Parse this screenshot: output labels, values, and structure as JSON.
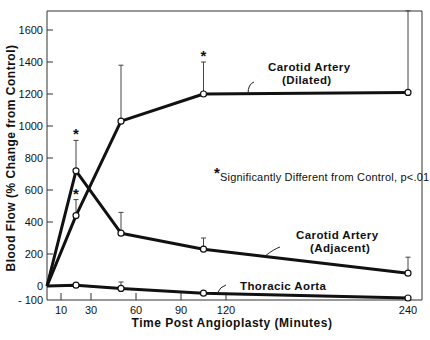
{
  "chart_data": {
    "type": "line",
    "title": "",
    "xlabel": "Time Post Angioplasty (Minutes)",
    "ylabel": "Blood Flow (% Change from Control)",
    "xlim": [
      0,
      240
    ],
    "ylim": [
      -100,
      1760
    ],
    "x_ticks": [
      10,
      30,
      60,
      90,
      120,
      240
    ],
    "y_ticks": [
      -100,
      0,
      200,
      400,
      600,
      800,
      1000,
      1200,
      1400,
      1600
    ],
    "grid": false,
    "legend": "inline labels",
    "annotation": "Significantly Different from Control, p<.01",
    "annotation_marker": "*",
    "x": [
      0,
      20,
      50,
      105,
      240
    ],
    "series": [
      {
        "name": "Carotid Artery (Dilated)",
        "label_lines": [
          "Carotid Artery",
          "(Dilated)"
        ],
        "values": [
          0,
          440,
          1030,
          1200,
          1210
        ],
        "error_upper": [
          null,
          540,
          1380,
          1400,
          1720
        ],
        "significant": [
          false,
          true,
          false,
          true,
          false
        ]
      },
      {
        "name": "Carotid Artery (Adjacent)",
        "label_lines": [
          "Carotid Artery",
          "(Adjacent)"
        ],
        "values": [
          0,
          720,
          330,
          230,
          80
        ],
        "error_upper": [
          null,
          910,
          460,
          300,
          180
        ],
        "significant": [
          false,
          true,
          false,
          false,
          false
        ]
      },
      {
        "name": "Thoracic Aorta",
        "label_lines": [
          "Thoracic Aorta"
        ],
        "values": [
          0,
          5,
          -15,
          -45,
          -75
        ],
        "error_upper": [
          null,
          null,
          25,
          null,
          null
        ],
        "significant": [
          false,
          false,
          false,
          false,
          false
        ]
      }
    ],
    "colors": {
      "line": "#111111",
      "axis": "#333333",
      "marker_fill": "#ffffff"
    }
  }
}
